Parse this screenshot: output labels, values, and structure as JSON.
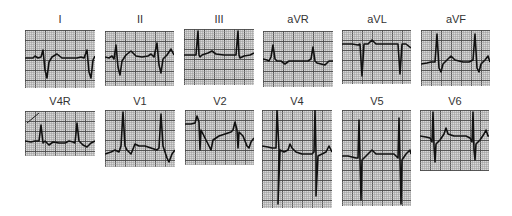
{
  "figure": {
    "grid": {
      "paper": "#d9d9d9",
      "minor": "#9a9a9a",
      "major": "#4a4a4a",
      "minor_step": 2,
      "major_step": 10
    },
    "trace_color": "#111111",
    "leads": [
      {
        "id": "I",
        "label": "I",
        "x": 25,
        "y": 30,
        "w": 70,
        "h": 58,
        "label_y": 13,
        "trace": "0,28 8,28 10,26 13,28 16,27 18,20 20,40 22,48 24,32 27,27 32,24 37,28 45,28 52,28 56,27 59,28 62,20 64,42 66,48 68,30 70,26"
      },
      {
        "id": "II",
        "label": "II",
        "x": 105,
        "y": 31,
        "w": 69,
        "h": 55,
        "label_y": 13,
        "trace": "0,26 4,27 7,25 9,28 11,14 13,36 15,44 17,30 21,24 26,20 31,25 37,26 43,25 46,23 49,26 52,12 54,34 56,42 58,28 62,24 66,18 69,24"
      },
      {
        "id": "III",
        "label": "III",
        "x": 184,
        "y": 29,
        "w": 70,
        "h": 56,
        "label_y": 13,
        "trace": "0,26 8,26 12,26 14,2 15,26 16,28 18,26 24,24 28,22 32,25 40,26 48,26 52,26 54,2 55,26 56,29 60,27 66,26 70,24"
      },
      {
        "id": "aVR",
        "label": "aVR",
        "x": 263,
        "y": 31,
        "w": 70,
        "h": 56,
        "label_y": 13,
        "trace": "0,28 4,29 6,30 8,26 10,14 12,28 14,30 18,30 22,33 26,30 32,30 40,30 45,30 48,28 50,16 52,30 54,32 58,33 62,34 66,30 70,30"
      },
      {
        "id": "aVL",
        "label": "aVL",
        "x": 342,
        "y": 30,
        "w": 69,
        "h": 54,
        "label_y": 13,
        "trace": "0,14 10,14 16,15 18,14 20,46 22,14 26,14 30,10 34,14 42,14 50,14 54,14 56,14 58,44 60,14 64,14 69,18"
      },
      {
        "id": "aVF",
        "label": "aVF",
        "x": 421,
        "y": 30,
        "w": 69,
        "h": 56,
        "label_y": 13,
        "trace": "0,34 6,33 10,32 14,32 16,4 18,38 20,42 22,34 26,30 30,26 34,30 42,32 48,32 52,30 54,4 56,38 58,42 60,34 64,30 67,26 69,32"
      },
      {
        "id": "V4R",
        "label": "V4R",
        "x": 25,
        "y": 111,
        "w": 70,
        "h": 45,
        "label_y": 95,
        "trace": "0,30 6,31 10,30 14,30 16,14 18,32 20,30 24,34 28,31 34,32 40,32 44,30 48,31 50,32 52,12 54,30 58,34 62,36 66,32 70,30"
      },
      {
        "id": "V1",
        "label": "V1",
        "x": 105,
        "y": 110,
        "w": 70,
        "h": 57,
        "label_y": 95,
        "trace": "0,44 6,42 10,40 14,42 16,36 18,2 20,36 22,40 26,44 30,34 34,36 40,36 46,38 52,40 54,38 56,4 58,36 60,42 62,48 64,52 67,44 70,40"
      },
      {
        "id": "V2",
        "label": "V2",
        "x": 185,
        "y": 110,
        "w": 69,
        "h": 55,
        "label_y": 95,
        "trace": "0,14 6,14 10,13 12,6 14,12 15,40 16,20 20,28 24,36 26,40 28,30 34,26 40,24 46,22 48,20 50,12 52,20 53,38 54,22 58,26 62,36 64,38 66,32 69,28"
      },
      {
        "id": "V4",
        "label": "V4",
        "x": 262,
        "y": 110,
        "w": 70,
        "h": 98,
        "label_y": 95,
        "trace": "0,36 6,37 10,38 14,38 15,0 17,40 16,94 18,40 22,42 26,40 28,34 30,38 34,42 40,44 46,44 50,44 52,42 53,0 54,44 54,86 56,46 60,44 64,42 67,36 70,42"
      },
      {
        "id": "V5",
        "label": "V5",
        "x": 342,
        "y": 110,
        "w": 69,
        "h": 96,
        "label_y": 95,
        "trace": "0,46 6,46 10,47 14,48 16,48 17,10 18,50 19,90 20,50 24,46 28,42 30,40 34,44 40,44 46,44 52,44 54,46 56,48 57,8 58,50 59,94 60,50 64,44 68,40 69,44"
      },
      {
        "id": "V6",
        "label": "V6",
        "x": 420,
        "y": 110,
        "w": 69,
        "h": 61,
        "label_y": 95,
        "trace": "0,26 6,27 10,28 12,32 13,2 14,36 15,52 16,34 20,30 24,24 26,18 28,24 34,26 40,26 46,26 50,28 52,32 53,2 54,40 55,50 56,34 60,30 64,24 66,20 68,26 69,26"
      }
    ]
  }
}
